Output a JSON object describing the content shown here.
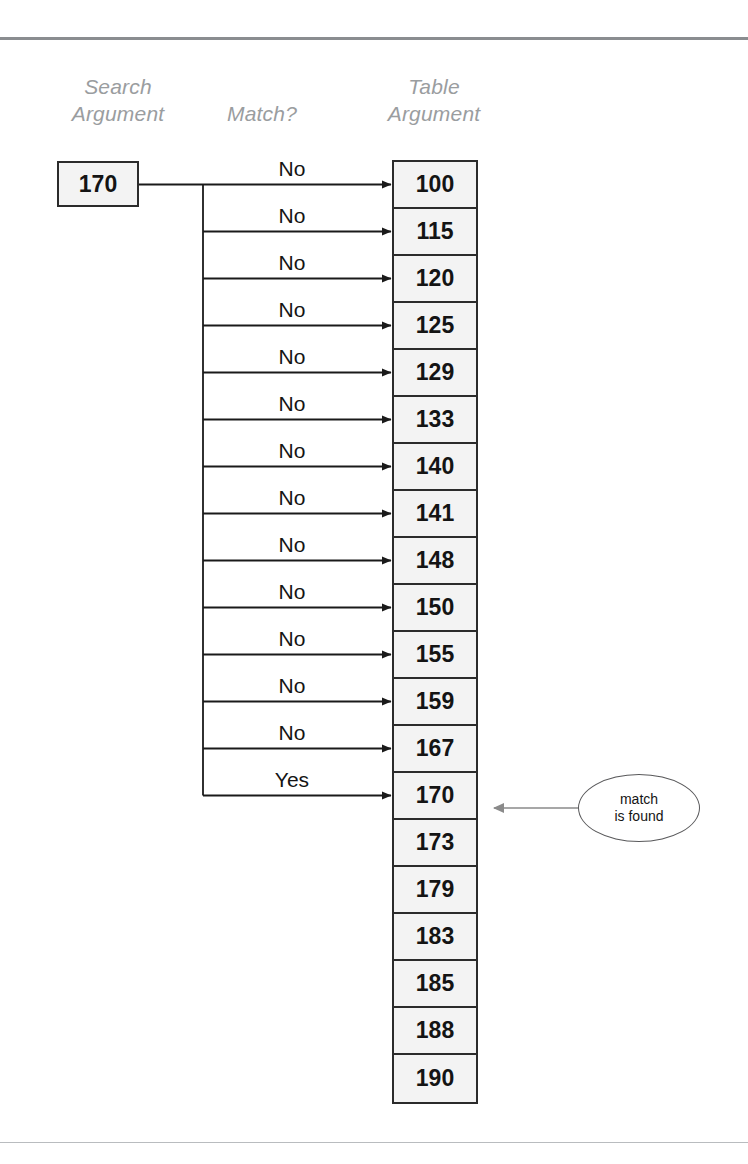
{
  "diagram": {
    "headers": {
      "search_argument": "Search\nArgument",
      "match": "Match?",
      "table_argument": "Table\nArgument"
    },
    "search_argument_value": "170",
    "table_values": [
      "100",
      "115",
      "120",
      "125",
      "129",
      "133",
      "140",
      "141",
      "148",
      "150",
      "155",
      "159",
      "167",
      "170",
      "173",
      "179",
      "183",
      "185",
      "188",
      "190"
    ],
    "match_labels": [
      "No",
      "No",
      "No",
      "No",
      "No",
      "No",
      "No",
      "No",
      "No",
      "No",
      "No",
      "No",
      "No",
      "Yes"
    ],
    "callout": {
      "line1": "match",
      "line2": "is found"
    },
    "colors": {
      "header_text": "#9a9d9f",
      "box_border": "#2b2b2b",
      "cell_fill": "#f3f3f3",
      "arrow_black": "#1a1a1a",
      "callout_arrow": "#8a8a8a",
      "rule_top": "#8a8d90",
      "rule_bottom": "#b9bcbf"
    }
  }
}
